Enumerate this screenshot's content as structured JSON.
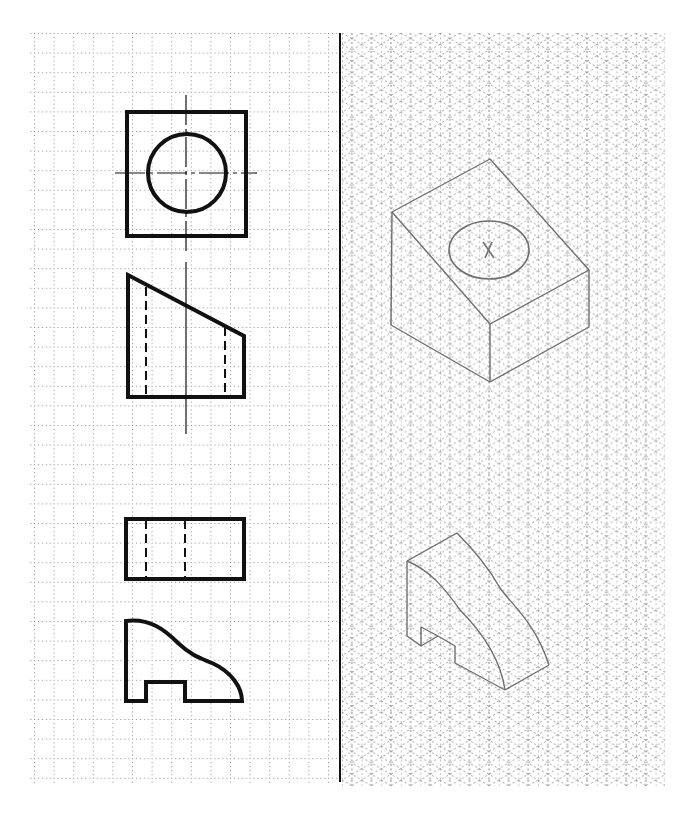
{
  "layout": {
    "left_panel": "square dot grid with orthographic views",
    "right_panel": "isometric dot grid with pencil sketches",
    "divider_x": 340
  },
  "colors": {
    "paper": "#ffffff",
    "grid_dots": "#777777",
    "ink": "#111111",
    "pencil": "#6f6f6f"
  },
  "grid": {
    "square": {
      "x0": 34,
      "y0": 33,
      "x1": 338,
      "y1": 782,
      "spacing": 19.6
    },
    "isometric": {
      "x0": 342,
      "y0": 33,
      "x1": 665,
      "y1": 787,
      "spacing": 19.6
    }
  },
  "views": [
    {
      "name": "object-1-top-view",
      "shape": "square with circle, centerlines"
    },
    {
      "name": "object-1-front-view",
      "shape": "trapezoid with sloped top, two hidden lines, vertical centerline"
    },
    {
      "name": "object-2-top-view",
      "shape": "rectangle with two hidden lines"
    },
    {
      "name": "object-2-front-view",
      "shape": "curved profile with notch at bottom"
    }
  ],
  "sketches": [
    {
      "name": "object-1-isometric",
      "shape": "block with sloped top face and circular hole"
    },
    {
      "name": "object-2-isometric",
      "shape": "curved-top block with bottom notch"
    }
  ]
}
